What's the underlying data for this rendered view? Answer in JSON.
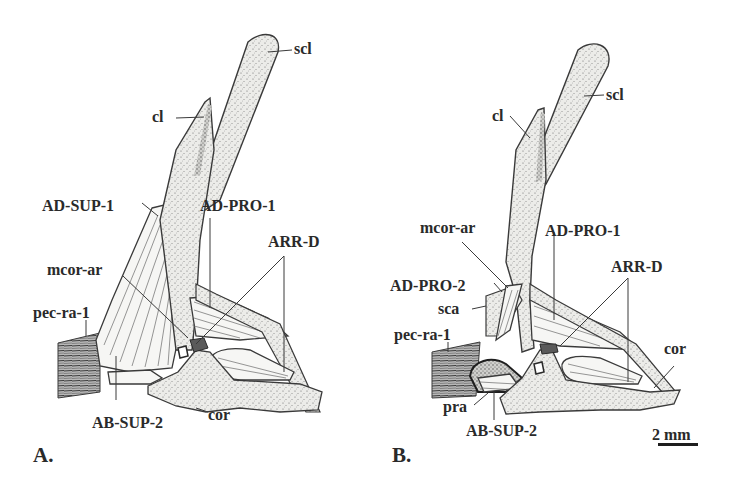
{
  "figure": {
    "scale_bar": {
      "label": "2 mm"
    },
    "panels": [
      {
        "id": "A",
        "panel_label": "A.",
        "labels": {
          "scl": "scl",
          "cl": "cl",
          "ad_sup_1": "AD-SUP-1",
          "ad_pro_1": "AD-PRO-1",
          "arr_d": "ARR-D",
          "mcor_ar": "mcor-ar",
          "pec_ra_1": "pec-ra-1",
          "ab_sup_2": "AB-SUP-2",
          "cor": "cor"
        }
      },
      {
        "id": "B",
        "panel_label": "B.",
        "labels": {
          "scl": "scl",
          "cl": "cl",
          "mcor_ar": "mcor-ar",
          "ad_pro_1": "AD-PRO-1",
          "ad_pro_2": "AD-PRO-2",
          "arr_d": "ARR-D",
          "sca": "sca",
          "pec_ra_1": "pec-ra-1",
          "cor": "cor",
          "pra": "pra",
          "ab_sup_2": "AB-SUP-2"
        }
      }
    ]
  }
}
